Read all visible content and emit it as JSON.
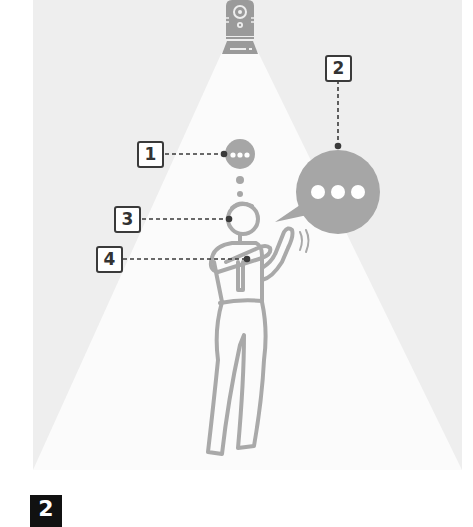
{
  "diagram": {
    "colors": {
      "panel_background": "#eeeeee",
      "light_cone": "#fbfbfb",
      "figure_stroke": "#a9a9a9",
      "bubble_fill": "#a6a6a6",
      "leader_line": "#3a3a3a",
      "label_border": "#3a3a3a",
      "badge_background": "#111111"
    },
    "device": {
      "name": "ceiling-camera-device"
    },
    "callouts": [
      {
        "number": "1",
        "target": "thought-bubble"
      },
      {
        "number": "2",
        "target": "speech-bubble"
      },
      {
        "number": "3",
        "target": "head"
      },
      {
        "number": "4",
        "target": "hand-gesture"
      }
    ],
    "step_badge": {
      "label": "2"
    }
  }
}
